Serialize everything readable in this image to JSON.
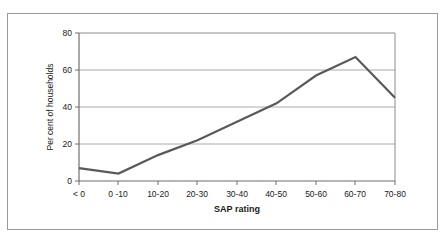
{
  "figure": {
    "frame_color": "#9a9a9a",
    "background": "#ffffff"
  },
  "chart_data": {
    "type": "line",
    "title": "",
    "xlabel": "SAP rating",
    "ylabel": "Per cent of households",
    "categories": [
      "< 0",
      "0 -10",
      "10-20",
      "20-30",
      "30-40",
      "40-50",
      "50-60",
      "60-70",
      "70-80"
    ],
    "values": [
      7,
      4,
      14,
      22,
      32,
      42,
      57,
      67,
      45
    ],
    "series": [
      {
        "name": "Per cent of households",
        "values": [
          7,
          4,
          14,
          22,
          32,
          42,
          57,
          67,
          45
        ],
        "color": "#595959"
      }
    ],
    "ylim": [
      0,
      80
    ],
    "yticks": [
      0,
      20,
      40,
      60,
      80
    ],
    "ytick_labels": [
      "0",
      "20",
      "40",
      "60",
      "80"
    ],
    "grid": true,
    "grid_axis": "y",
    "grid_color": "#aaaaaa",
    "legend": false,
    "legend_position": "none",
    "line_color": "#595959",
    "line_width": 2.2,
    "axis_color": "#6f6f6f"
  },
  "axes": {
    "y_tick_labels": [
      "80",
      "60",
      "40",
      "20",
      "0"
    ],
    "x_tick_labels": [
      "< 0",
      "0 -10",
      "10-20",
      "20-30",
      "30-40",
      "40-50",
      "50-60",
      "60-70",
      "70-80"
    ],
    "y_axis_title": "Per cent of households",
    "x_axis_title": "SAP rating"
  }
}
